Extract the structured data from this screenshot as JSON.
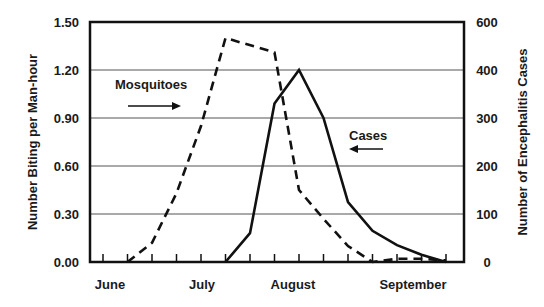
{
  "chart_data": {
    "type": "line",
    "title": "",
    "xlabel": "",
    "ylabel": "Number Biting per Man-hour",
    "ylabel_right": "Number of Encephalitis Cases",
    "ylim": [
      0,
      1.5
    ],
    "yticks_left": [
      "0.00",
      "0.30",
      "0.60",
      "0.90",
      "1.20",
      "1.50"
    ],
    "yticks_right": [
      "0",
      "100",
      "200",
      "300",
      "400",
      "600"
    ],
    "xtick_labels": [
      "June",
      "July",
      "August",
      "September"
    ],
    "grid": true,
    "legend": "inline annotations with arrows",
    "x_index_count": 15,
    "series": [
      {
        "name": "Mosquitoes",
        "axis": "left",
        "style": "dashed",
        "x": [
          1,
          2,
          3,
          4,
          5,
          7,
          8,
          9,
          10,
          11,
          12,
          13,
          14
        ],
        "values": [
          0.0,
          0.12,
          0.43,
          0.85,
          1.4,
          1.31,
          0.45,
          0.27,
          0.1,
          0.0,
          0.02,
          0.02,
          0.01
        ]
      },
      {
        "name": "Cases",
        "axis": "right",
        "style": "solid",
        "x": [
          5,
          6,
          7,
          8,
          9,
          10,
          11,
          12,
          13,
          14
        ],
        "values": [
          0,
          60,
          330,
          400,
          300,
          125,
          65,
          35,
          15,
          0
        ]
      }
    ],
    "annotations": [
      {
        "text": "Mosquitoes",
        "arrow": "right"
      },
      {
        "text": "Cases",
        "arrow": "left"
      }
    ]
  },
  "labels": {
    "mosquitoes": "Mosquitoes",
    "cases": "Cases"
  }
}
